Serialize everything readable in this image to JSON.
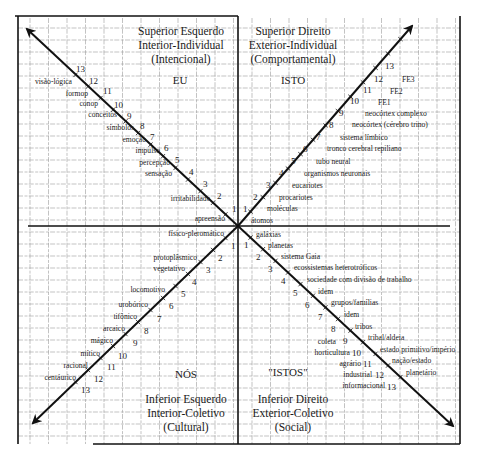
{
  "diagram": {
    "type": "four-quadrant holon diagram",
    "colors": {
      "ink": "#111111",
      "grid": "#9a9a9a",
      "background": "#ffffff"
    },
    "quadrants": {
      "upper_left": {
        "title_lines": [
          "Superior Esquerdo",
          "Interior-Individual",
          "(Intencional)"
        ],
        "pronoun": "EU",
        "items": [
          {
            "n": "1",
            "label": "apreensão"
          },
          {
            "n": "2",
            "label": "irritabilidade"
          },
          {
            "n": "3",
            "label": ""
          },
          {
            "n": "4",
            "label": "sensação"
          },
          {
            "n": "5",
            "label": "percepção"
          },
          {
            "n": "6",
            "label": "impulso"
          },
          {
            "n": "7",
            "label": "emoção"
          },
          {
            "n": "8",
            "label": "símbolos"
          },
          {
            "n": "9",
            "label": "conceitos"
          },
          {
            "n": "10",
            "label": "conop"
          },
          {
            "n": "11",
            "label": "formop"
          },
          {
            "n": "12",
            "label": "visão-lógica"
          },
          {
            "n": "13",
            "label": ""
          }
        ]
      },
      "upper_right": {
        "title_lines": [
          "Superior Direito",
          "Exterior-Individual",
          "(Comportamental)"
        ],
        "pronoun": "ISTO",
        "items": [
          {
            "n": "1",
            "label": "átomos"
          },
          {
            "n": "2",
            "label": "moléculas"
          },
          {
            "n": "3",
            "label": "procariotes"
          },
          {
            "n": "4",
            "label": "eucariotes"
          },
          {
            "n": "5",
            "label": "organismos neuronais"
          },
          {
            "n": "6",
            "label": "tubo neural"
          },
          {
            "n": "7",
            "label": "tronco cerebral repiliano"
          },
          {
            "n": "8",
            "label": "sistema límbico"
          },
          {
            "n": "9",
            "label": "neocórtex (cérebro trino)"
          },
          {
            "n": "10",
            "label": "neocórtex complexo"
          },
          {
            "n": "11",
            "label": "FE1"
          },
          {
            "n": "12",
            "label": "FE2"
          },
          {
            "n": "13",
            "label": "FE3"
          }
        ]
      },
      "lower_left": {
        "title_lines": [
          "Inferior Esquerdo",
          "Interior-Coletivo",
          "(Cultural)"
        ],
        "pronoun": "NÓS",
        "items": [
          {
            "n": "1",
            "label": "físico-pleromático"
          },
          {
            "n": "2",
            "label": "protoplâsmico"
          },
          {
            "n": "3",
            "label": "vegetativo"
          },
          {
            "n": "4",
            "label": ""
          },
          {
            "n": "5",
            "label": "locomotivo"
          },
          {
            "n": "6",
            "label": "urobórico"
          },
          {
            "n": "7",
            "label": "tifônico"
          },
          {
            "n": "8",
            "label": "arcaico"
          },
          {
            "n": "9",
            "label": "mágico"
          },
          {
            "n": "10",
            "label": "mítico"
          },
          {
            "n": "11",
            "label": "racional"
          },
          {
            "n": "12",
            "label": "centáurico"
          },
          {
            "n": "13",
            "label": ""
          }
        ]
      },
      "lower_right": {
        "title_lines": [
          "Inferior Direito",
          "Exterior-Coletivo",
          "(Social)"
        ],
        "pronoun": "\"ISTOS\"",
        "items": [
          {
            "n": "1",
            "label": "galáxias"
          },
          {
            "n": "2",
            "label": "planetas"
          },
          {
            "n": "3",
            "label": "sistema Gaia"
          },
          {
            "n": "4",
            "label": "ecossistemas heterotróficos"
          },
          {
            "n": "5",
            "label": "sociedade com divisão de trabalho"
          },
          {
            "n": "6",
            "label": "idem"
          },
          {
            "n": "7",
            "label": "grupos/famílias"
          },
          {
            "n": "8",
            "label": "idem"
          },
          {
            "n": "9",
            "label": "tribos"
          },
          {
            "n": "10",
            "label": "tribal/aldeia"
          },
          {
            "n": "11",
            "label": "estado primitivo/império"
          },
          {
            "n": "12",
            "label": "nação/estado"
          },
          {
            "n": "13",
            "label": "planetário"
          }
        ],
        "left_side_labels": [
          {
            "n": "9",
            "label": "coleta"
          },
          {
            "n": "10",
            "label": "horticultura"
          },
          {
            "n": "11",
            "label": "agrário"
          },
          {
            "n": "12",
            "label": "industrial"
          },
          {
            "n": "13",
            "label": "informacional"
          }
        ]
      }
    }
  }
}
